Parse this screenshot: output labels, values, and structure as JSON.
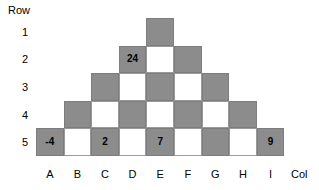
{
  "axes": {
    "row_title": "Row",
    "col_title": "Col",
    "row_labels": [
      "1",
      "2",
      "3",
      "4",
      "5"
    ],
    "col_labels": [
      "A",
      "B",
      "C",
      "D",
      "E",
      "F",
      "G",
      "H",
      "I"
    ]
  },
  "colors": {
    "shaded_cell": "#8c8c8c",
    "blank_cell": "#ffffff",
    "cell_border": "#7d7d7d",
    "text": "#000000",
    "background": "#ffffff"
  },
  "chart_data": {
    "type": "heatmap",
    "title": "",
    "xlabel": "Col",
    "ylabel": "Row",
    "categories": [
      "A",
      "B",
      "C",
      "D",
      "E",
      "F",
      "G",
      "H",
      "I"
    ],
    "rows": [
      "1",
      "2",
      "3",
      "4",
      "5"
    ],
    "grid": false,
    "legend": "none",
    "shape": "pyramid",
    "cells": [
      {
        "row": "1",
        "col": "E",
        "shaded": true,
        "value": ""
      },
      {
        "row": "2",
        "col": "D",
        "shaded": true,
        "value": "24"
      },
      {
        "row": "2",
        "col": "E",
        "shaded": false,
        "value": ""
      },
      {
        "row": "2",
        "col": "F",
        "shaded": true,
        "value": ""
      },
      {
        "row": "3",
        "col": "C",
        "shaded": true,
        "value": ""
      },
      {
        "row": "3",
        "col": "D",
        "shaded": false,
        "value": ""
      },
      {
        "row": "3",
        "col": "E",
        "shaded": true,
        "value": ""
      },
      {
        "row": "3",
        "col": "F",
        "shaded": false,
        "value": ""
      },
      {
        "row": "3",
        "col": "G",
        "shaded": true,
        "value": ""
      },
      {
        "row": "4",
        "col": "B",
        "shaded": true,
        "value": ""
      },
      {
        "row": "4",
        "col": "C",
        "shaded": false,
        "value": ""
      },
      {
        "row": "4",
        "col": "D",
        "shaded": true,
        "value": ""
      },
      {
        "row": "4",
        "col": "E",
        "shaded": false,
        "value": ""
      },
      {
        "row": "4",
        "col": "F",
        "shaded": true,
        "value": ""
      },
      {
        "row": "4",
        "col": "G",
        "shaded": false,
        "value": ""
      },
      {
        "row": "4",
        "col": "H",
        "shaded": true,
        "value": ""
      },
      {
        "row": "5",
        "col": "A",
        "shaded": true,
        "value": "-4"
      },
      {
        "row": "5",
        "col": "B",
        "shaded": false,
        "value": ""
      },
      {
        "row": "5",
        "col": "C",
        "shaded": true,
        "value": "2"
      },
      {
        "row": "5",
        "col": "D",
        "shaded": false,
        "value": ""
      },
      {
        "row": "5",
        "col": "E",
        "shaded": true,
        "value": "7"
      },
      {
        "row": "5",
        "col": "F",
        "shaded": false,
        "value": ""
      },
      {
        "row": "5",
        "col": "G",
        "shaded": true,
        "value": ""
      },
      {
        "row": "5",
        "col": "H",
        "shaded": false,
        "value": ""
      },
      {
        "row": "5",
        "col": "I",
        "shaded": true,
        "value": "9"
      }
    ],
    "labeled_values": [
      {
        "row": "2",
        "col": "D",
        "value": 24
      },
      {
        "row": "5",
        "col": "A",
        "value": -4
      },
      {
        "row": "5",
        "col": "C",
        "value": 2
      },
      {
        "row": "5",
        "col": "E",
        "value": 7
      },
      {
        "row": "5",
        "col": "I",
        "value": 9
      }
    ]
  }
}
